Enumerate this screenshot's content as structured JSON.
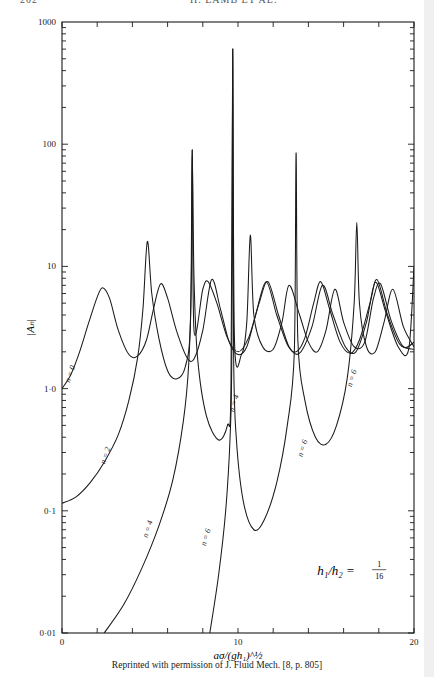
{
  "page": {
    "page_number": "202",
    "running_title": "H. LAMB ET AL.",
    "caption": "Reprinted with permission of J. Fluid Mech. [8, p. 805]"
  },
  "chart_data": {
    "type": "line",
    "title": "",
    "xlabel": "aσ/(gh₁)^½",
    "ylabel": "|Aₙ|",
    "xlim": [
      0,
      20
    ],
    "ylim": [
      0.01,
      1000
    ],
    "yscale": "log",
    "x_ticks": [
      0,
      10,
      20
    ],
    "x_tick_labels": [
      "0",
      "10",
      "20"
    ],
    "y_ticks": [
      0.01,
      0.1,
      1.0,
      10,
      100,
      1000
    ],
    "y_tick_labels": [
      "0·01",
      "0·1",
      "1·0",
      "10",
      "100",
      "1000"
    ],
    "grid": false,
    "annotation": {
      "text_lhs": "h₁/h₂ =",
      "numerator": "1",
      "denominator": "16",
      "x": 14.5,
      "y": 0.03
    },
    "series": [
      {
        "name": "n = 0",
        "label_pos": {
          "x": 0.6,
          "y": 1.3
        },
        "points": [
          [
            0,
            1.0
          ],
          [
            0.5,
            1.3
          ],
          [
            1.0,
            2.0
          ],
          [
            1.5,
            3.4
          ],
          [
            2.0,
            5.6
          ],
          [
            2.3,
            6.7
          ],
          [
            2.7,
            5.5
          ],
          [
            3.2,
            3.0
          ],
          [
            3.8,
            1.9
          ],
          [
            4.3,
            1.85
          ],
          [
            4.8,
            2.5
          ],
          [
            5.2,
            4.5
          ],
          [
            5.6,
            7.2
          ],
          [
            6.0,
            5.5
          ],
          [
            6.5,
            3.0
          ],
          [
            7.1,
            1.8
          ],
          [
            7.5,
            1.75
          ],
          [
            8.0,
            3.0
          ],
          [
            8.5,
            7.8
          ],
          [
            9.0,
            4.5
          ],
          [
            9.5,
            2.4
          ],
          [
            10.0,
            1.9
          ],
          [
            10.5,
            2.2
          ],
          [
            11.0,
            4.0
          ],
          [
            11.6,
            7.5
          ],
          [
            12.2,
            4.0
          ],
          [
            12.8,
            2.3
          ],
          [
            13.3,
            2.0
          ],
          [
            13.8,
            2.6
          ],
          [
            14.3,
            5.0
          ],
          [
            14.7,
            7.5
          ],
          [
            15.2,
            4.5
          ],
          [
            15.8,
            2.4
          ],
          [
            16.4,
            1.95
          ],
          [
            16.9,
            2.5
          ],
          [
            17.5,
            5.0
          ],
          [
            17.9,
            7.8
          ],
          [
            18.5,
            4.0
          ],
          [
            19.2,
            2.3
          ],
          [
            20,
            2.1
          ]
        ]
      },
      {
        "name": "n = 2",
        "label_pos": {
          "x": 2.6,
          "y": 0.28
        },
        "points": [
          [
            0,
            0.115
          ],
          [
            0.8,
            0.13
          ],
          [
            1.6,
            0.17
          ],
          [
            2.4,
            0.25
          ],
          [
            3.2,
            0.42
          ],
          [
            3.8,
            0.8
          ],
          [
            4.3,
            1.8
          ],
          [
            4.6,
            4.5
          ],
          [
            4.85,
            16
          ],
          [
            5.1,
            6.0
          ],
          [
            5.5,
            2.6
          ],
          [
            6.0,
            1.4
          ],
          [
            6.5,
            1.2
          ],
          [
            7.0,
            1.5
          ],
          [
            7.3,
            3.5
          ],
          [
            7.4,
            90
          ],
          [
            7.5,
            3.0
          ],
          [
            8.0,
            6.5
          ],
          [
            8.3,
            7.5
          ],
          [
            8.8,
            5.0
          ],
          [
            9.4,
            2.6
          ],
          [
            10.0,
            2.0
          ],
          [
            10.6,
            2.6
          ],
          [
            11.2,
            5.0
          ],
          [
            11.7,
            7.5
          ],
          [
            12.3,
            4.0
          ],
          [
            12.9,
            2.2
          ],
          [
            13.5,
            1.95
          ],
          [
            14.2,
            3.2
          ],
          [
            14.8,
            7.0
          ],
          [
            15.4,
            4.0
          ],
          [
            16.1,
            2.2
          ],
          [
            16.7,
            2.0
          ],
          [
            17.3,
            3.5
          ],
          [
            17.8,
            7.4
          ],
          [
            18.4,
            4.2
          ],
          [
            19.1,
            2.2
          ],
          [
            19.7,
            2.1
          ],
          [
            20,
            10
          ]
        ]
      },
      {
        "name": "n = 4",
        "label_pos": {
          "x": 5.0,
          "y": 0.07
        },
        "points": [
          [
            2.4,
            0.01
          ],
          [
            3.5,
            0.017
          ],
          [
            4.5,
            0.033
          ],
          [
            5.5,
            0.075
          ],
          [
            6.3,
            0.18
          ],
          [
            6.9,
            0.55
          ],
          [
            7.2,
            1.6
          ],
          [
            7.35,
            8
          ],
          [
            7.4,
            90
          ],
          [
            7.5,
            8
          ],
          [
            7.7,
            1.8
          ],
          [
            8.2,
            0.6
          ],
          [
            8.9,
            0.38
          ],
          [
            9.4,
            0.5
          ],
          [
            9.6,
            1.0
          ],
          [
            9.7,
            600
          ],
          [
            9.8,
            2.5
          ],
          [
            10.2,
            1.9
          ],
          [
            10.5,
            3.5
          ],
          [
            10.7,
            18
          ],
          [
            10.9,
            4.0
          ],
          [
            11.4,
            2.2
          ],
          [
            12.0,
            2.1
          ],
          [
            12.5,
            3.5
          ],
          [
            12.9,
            7.0
          ],
          [
            13.5,
            4.0
          ],
          [
            14.0,
            2.4
          ],
          [
            14.5,
            2.0
          ],
          [
            15.0,
            3.0
          ],
          [
            15.5,
            6.5
          ],
          [
            16.0,
            3.5
          ],
          [
            16.6,
            2.2
          ],
          [
            17.2,
            2.4
          ],
          [
            17.7,
            5.5
          ],
          [
            18.1,
            7.2
          ],
          [
            18.7,
            3.6
          ],
          [
            19.4,
            2.2
          ],
          [
            20,
            2.4
          ]
        ]
      },
      {
        "name": "n = 6",
        "label_pos": {
          "x": 8.3,
          "y": 0.06
        },
        "points": [
          [
            8.4,
            0.01
          ],
          [
            8.9,
            0.03
          ],
          [
            9.3,
            0.1
          ],
          [
            9.55,
            0.4
          ],
          [
            9.65,
            2.0
          ],
          [
            9.7,
            600
          ],
          [
            9.75,
            2.0
          ],
          [
            9.9,
            0.4
          ],
          [
            10.3,
            0.12
          ],
          [
            10.9,
            0.07
          ],
          [
            11.5,
            0.085
          ],
          [
            12.2,
            0.17
          ],
          [
            12.8,
            0.5
          ],
          [
            13.2,
            2.0
          ],
          [
            13.3,
            85
          ],
          [
            13.4,
            2.5
          ],
          [
            13.8,
            0.8
          ],
          [
            14.4,
            0.4
          ],
          [
            15.0,
            0.35
          ],
          [
            15.6,
            0.5
          ],
          [
            16.2,
            1.2
          ],
          [
            16.6,
            5.0
          ],
          [
            16.75,
            23
          ],
          [
            16.9,
            5.0
          ],
          [
            17.3,
            2.2
          ],
          [
            17.8,
            2.0
          ],
          [
            18.3,
            3.5
          ],
          [
            18.8,
            6.5
          ],
          [
            19.4,
            3.2
          ],
          [
            20,
            2.2
          ]
        ]
      }
    ],
    "extra_labels": [
      {
        "text": "n = 4",
        "x": 9.9,
        "y": 0.75
      },
      {
        "text": "n = 6",
        "x": 13.8,
        "y": 0.32
      },
      {
        "text": "n = 6",
        "x": 16.6,
        "y": 1.2
      }
    ]
  }
}
